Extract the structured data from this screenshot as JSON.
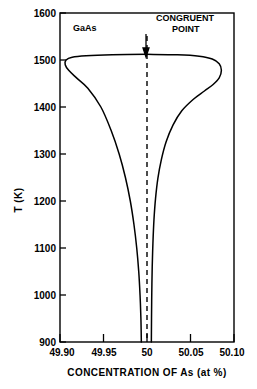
{
  "chart_data": {
    "type": "line",
    "title": "",
    "material_label": "GaAs",
    "xlabel": "CONCENTRATION OF As (at %)",
    "ylabel": "T (K)",
    "xlim": [
      49.9,
      50.1
    ],
    "ylim": [
      900,
      1600
    ],
    "grid": false,
    "legend_position": "none",
    "x_ticks": [
      49.9,
      49.95,
      50,
      50.05,
      50.1
    ],
    "x_tick_labels": [
      "49.90",
      "49.95",
      "50",
      "50.05",
      "50.10"
    ],
    "y_ticks": [
      900,
      1000,
      1100,
      1200,
      1300,
      1400,
      1500,
      1600
    ],
    "y_tick_labels": [
      "900",
      "1000",
      "1100",
      "1200",
      "1300",
      "1400",
      "1500",
      "1600"
    ],
    "annotations": [
      {
        "name": "congruent-point",
        "text_line_1": "CONGRUENT",
        "text_line_2": "POINT",
        "x": 50.0,
        "y_arrow_tip": 1510,
        "marker": "down-arrow",
        "guide": "vertical-dashed-line"
      },
      {
        "name": "material",
        "text_line_1": "GaAs",
        "x": 49.915,
        "y": 1555
      }
    ],
    "series": [
      {
        "name": "solidus-left-branch",
        "comment": "Left (Ga-rich) boundary of the GaAs solidus lens, from bottom convergence up over apex",
        "points": [
          [
            49.9935,
            900
          ],
          [
            49.993,
            950
          ],
          [
            49.992,
            1000
          ],
          [
            49.9905,
            1050
          ],
          [
            49.9882,
            1100
          ],
          [
            49.985,
            1150
          ],
          [
            49.9808,
            1200
          ],
          [
            49.9752,
            1250
          ],
          [
            49.968,
            1300
          ],
          [
            49.9588,
            1350
          ],
          [
            49.947,
            1400
          ],
          [
            49.932,
            1440
          ],
          [
            49.919,
            1462
          ],
          [
            49.91,
            1478
          ],
          [
            49.906,
            1490
          ],
          [
            49.907,
            1500
          ],
          [
            49.914,
            1506
          ],
          [
            49.93,
            1509
          ],
          [
            49.96,
            1511
          ],
          [
            50.0,
            1512
          ]
        ]
      },
      {
        "name": "solidus-right-branch",
        "comment": "Right (As-rich) boundary of the GaAs solidus lens, from apex down to bottom convergence",
        "points": [
          [
            50.0,
            1512
          ],
          [
            50.035,
            1511
          ],
          [
            50.06,
            1508
          ],
          [
            50.075,
            1502
          ],
          [
            50.083,
            1492
          ],
          [
            50.0855,
            1478
          ],
          [
            50.083,
            1462
          ],
          [
            50.076,
            1448
          ],
          [
            50.066,
            1434
          ],
          [
            50.053,
            1416
          ],
          [
            50.04,
            1392
          ],
          [
            50.03,
            1362
          ],
          [
            50.022,
            1326
          ],
          [
            50.0165,
            1288
          ],
          [
            50.0125,
            1248
          ],
          [
            50.0098,
            1205
          ],
          [
            50.008,
            1160
          ],
          [
            50.0068,
            1110
          ],
          [
            50.006,
            1060
          ],
          [
            50.0055,
            1005
          ],
          [
            50.0052,
            950
          ],
          [
            50.005,
            900
          ]
        ]
      }
    ]
  }
}
